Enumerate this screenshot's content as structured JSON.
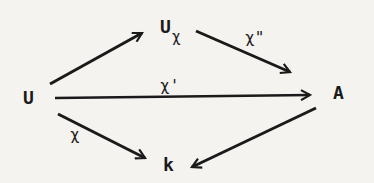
{
  "diagram": {
    "type": "commutative-diagram",
    "nodes": {
      "U": {
        "label": "U"
      },
      "U_chi": {
        "label": "U",
        "subscript": "χ"
      },
      "A": {
        "label": "A"
      },
      "k": {
        "label": "k"
      }
    },
    "edges": [
      {
        "from": "U",
        "to": "U_chi",
        "label": ""
      },
      {
        "from": "U_chi",
        "to": "A",
        "label": "χ\""
      },
      {
        "from": "U",
        "to": "A",
        "label": "χ'"
      },
      {
        "from": "U",
        "to": "k",
        "label": "χ"
      },
      {
        "from": "A",
        "to": "k",
        "label": ""
      }
    ],
    "colors": {
      "ink": "#1a1a1a",
      "paper": "#f4f3f0"
    }
  }
}
